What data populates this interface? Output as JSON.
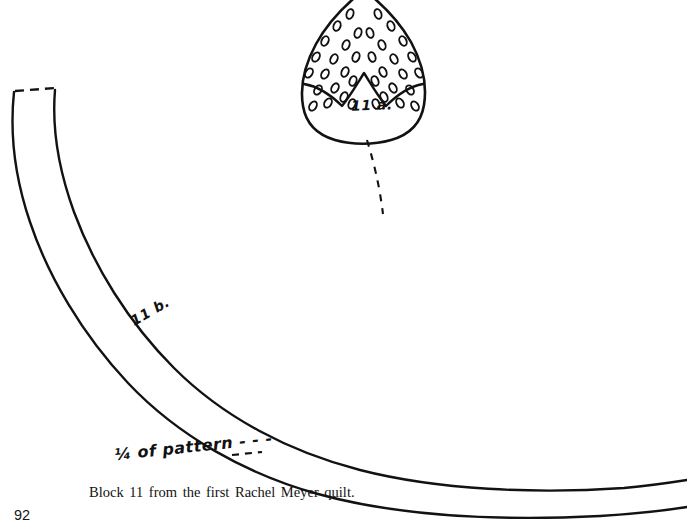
{
  "page": {
    "number": "92",
    "background_color": "#ffffff",
    "ink_color": "#111111"
  },
  "caption": {
    "text": "Block 11 from the first Rachel Meyer quilt."
  },
  "figures": {
    "leaf": {
      "label": "11 a.",
      "description": "teardrop shaped quilt template with stippled seed ovals in upper section",
      "seed_count": 42
    },
    "band": {
      "label": "11 b.",
      "description": "long curved band template with dashed top edge",
      "annotation": "1/4 of pattern - - -"
    }
  },
  "annotations": {
    "quarter_of_pattern": "¼ of pattern - - -",
    "dashed_guide": "dashed curve descending from leaf tip"
  },
  "colors": {
    "ink": "#111111",
    "paper": "#ffffff"
  }
}
